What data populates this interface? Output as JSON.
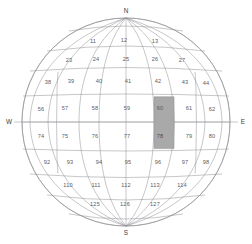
{
  "figure": {
    "name": "globe-grid-diagram",
    "projection": "orthographic",
    "colors": {
      "background": "#ffffff",
      "graticule": "#8e8e94",
      "cell_fill": "#ffffff",
      "highlight_fill": "#a9a9a9",
      "label": "#5a5a5f",
      "compass_label": "#3a3a3e"
    },
    "center": {
      "cx": 126,
      "cy": 122
    },
    "radius": {
      "rx": 104,
      "ry": 104
    }
  },
  "compass": {
    "north": "N",
    "south": "S",
    "east": "E",
    "west": "W"
  },
  "grid": {
    "highlighted_cell": "78",
    "row_count": 8,
    "rows": [
      {
        "index": 0,
        "lat_band": [
          45,
          67.5
        ],
        "cells": [
          {
            "id": "11",
            "x": 93,
            "y": 42
          },
          {
            "id": "12",
            "x": 124,
            "y": 41
          },
          {
            "id": "13",
            "x": 155,
            "y": 42
          }
        ]
      },
      {
        "index": 1,
        "lat_band": [
          22.5,
          45
        ],
        "cells": [
          {
            "id": "23",
            "x": 69,
            "y": 61
          },
          {
            "id": "24",
            "x": 96,
            "y": 60
          },
          {
            "id": "25",
            "x": 126,
            "y": 60
          },
          {
            "id": "26",
            "x": 155,
            "y": 60
          },
          {
            "id": "27",
            "x": 182,
            "y": 61
          }
        ]
      },
      {
        "index": 2,
        "lat_band": [
          11.25,
          22.5
        ],
        "cells": [
          {
            "id": "38",
            "x": 48,
            "y": 83
          },
          {
            "id": "39",
            "x": 71,
            "y": 82
          },
          {
            "id": "40",
            "x": 99,
            "y": 82
          },
          {
            "id": "41",
            "x": 128,
            "y": 82
          },
          {
            "id": "42",
            "x": 158,
            "y": 82
          },
          {
            "id": "43",
            "x": 185,
            "y": 83
          },
          {
            "id": "44",
            "x": 206,
            "y": 84
          }
        ]
      },
      {
        "index": 3,
        "lat_band": [
          0,
          11.25
        ],
        "cells": [
          {
            "id": "56",
            "x": 41,
            "y": 110
          },
          {
            "id": "57",
            "x": 65,
            "y": 109
          },
          {
            "id": "58",
            "x": 95,
            "y": 109
          },
          {
            "id": "59",
            "x": 127,
            "y": 109
          },
          {
            "id": "60",
            "x": 160,
            "y": 109
          },
          {
            "id": "61",
            "x": 189,
            "y": 109
          },
          {
            "id": "62",
            "x": 212,
            "y": 110
          }
        ]
      },
      {
        "index": 4,
        "lat_band": [
          -11.25,
          0
        ],
        "cells": [
          {
            "id": "74",
            "x": 41,
            "y": 137
          },
          {
            "id": "75",
            "x": 65,
            "y": 137
          },
          {
            "id": "76",
            "x": 95,
            "y": 137
          },
          {
            "id": "77",
            "x": 127,
            "y": 137
          },
          {
            "id": "78",
            "x": 160,
            "y": 137
          },
          {
            "id": "79",
            "x": 189,
            "y": 137
          },
          {
            "id": "80",
            "x": 212,
            "y": 137
          }
        ]
      },
      {
        "index": 5,
        "lat_band": [
          -22.5,
          -11.25
        ],
        "cells": [
          {
            "id": "92",
            "x": 47,
            "y": 163
          },
          {
            "id": "93",
            "x": 70,
            "y": 163
          },
          {
            "id": "94",
            "x": 99,
            "y": 163
          },
          {
            "id": "95",
            "x": 128,
            "y": 163
          },
          {
            "id": "96",
            "x": 158,
            "y": 163
          },
          {
            "id": "97",
            "x": 185,
            "y": 163
          },
          {
            "id": "98",
            "x": 206,
            "y": 163
          }
        ]
      },
      {
        "index": 6,
        "lat_band": [
          -45,
          -22.5
        ],
        "cells": [
          {
            "id": "110",
            "x": 68,
            "y": 186
          },
          {
            "id": "111",
            "x": 96,
            "y": 186
          },
          {
            "id": "112",
            "x": 126,
            "y": 186
          },
          {
            "id": "113",
            "x": 155,
            "y": 186
          },
          {
            "id": "114",
            "x": 182,
            "y": 186
          }
        ]
      },
      {
        "index": 7,
        "lat_band": [
          -67.5,
          -45
        ],
        "cells": [
          {
            "id": "125",
            "x": 95,
            "y": 205
          },
          {
            "id": "126",
            "x": 125,
            "y": 205
          },
          {
            "id": "127",
            "x": 155,
            "y": 205
          }
        ]
      }
    ]
  }
}
